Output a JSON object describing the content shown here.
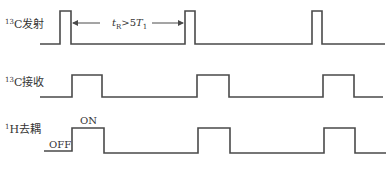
{
  "rows": [
    {
      "label_sup": "13",
      "label_main": "C发射",
      "name": "13C-excitation",
      "pulses": [
        [
          60,
          71
        ],
        [
          185,
          195
        ],
        [
          312,
          322
        ]
      ],
      "baseline_y": 44,
      "top_y": 11,
      "x_start": 40,
      "x_end": 385
    },
    {
      "label_sup": "13",
      "label_main": "C接收",
      "name": "13C-acquisition",
      "pulses": [
        [
          72,
          102
        ],
        [
          197,
          229
        ],
        [
          323,
          354
        ]
      ],
      "baseline_y": 97,
      "top_y": 75,
      "x_start": 40,
      "x_end": 383
    },
    {
      "label_sup": "1",
      "label_main": "H去耦",
      "name": "1H-decoupling",
      "pulses": [
        [
          72,
          104
        ],
        [
          198,
          230
        ],
        [
          324,
          355
        ]
      ],
      "baseline_y": 152,
      "top_y": 128,
      "x_start": 44,
      "x_end": 386
    }
  ],
  "annotations": {
    "interval_t": "t",
    "interval_sub": "R",
    "interval_mid": ">5",
    "interval_T": "T",
    "interval_T_sub": "1",
    "off_label": "OFF",
    "on_label": "ON"
  }
}
